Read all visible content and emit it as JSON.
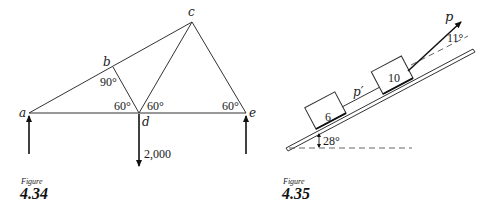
{
  "figures": [
    {
      "id": "fig-4-34",
      "caption_word": "Figure",
      "caption_number": "4.34",
      "joints": {
        "a": "a",
        "b": "b",
        "c": "c",
        "d": "d",
        "e": "e"
      },
      "angles": {
        "at_b": "90°",
        "at_d_left": "60°",
        "at_d_right": "60°",
        "at_e": "60°"
      },
      "load": "2,000"
    },
    {
      "id": "fig-4-35",
      "caption_word": "Figure",
      "caption_number": "4.35",
      "blocks": {
        "lower": "6",
        "upper": "10"
      },
      "force_labels": {
        "pull": "p",
        "rope": "p′"
      },
      "angles": {
        "incline": "28°",
        "pull": "11°"
      }
    }
  ]
}
